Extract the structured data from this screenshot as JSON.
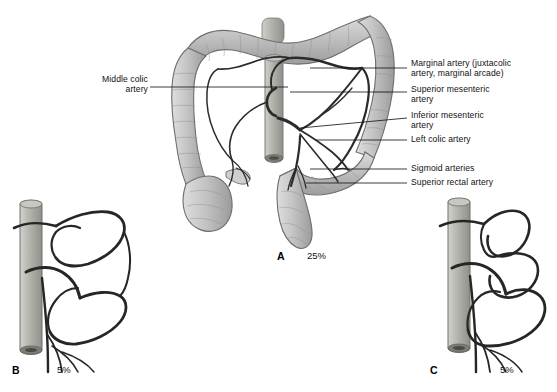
{
  "figure": {
    "background_color": "#ffffff",
    "colon_fill_light": "#d6d6d6",
    "colon_fill_mid": "#b9b9b9",
    "colon_fill_dark": "#9a9a9a",
    "colon_outline": "#6e6e6e",
    "vessel_color": "#2b2b2b",
    "aorta_fill": "#b5b5b0",
    "leader_color": "#1a1a1a",
    "text_color": "#111111"
  },
  "labels": {
    "left": [
      {
        "id": "middle-colic-artery",
        "text": "Middle colic artery",
        "x": 78,
        "y": 79,
        "leader": {
          "x1": 150,
          "y1": 87,
          "x2": 288,
          "y2": 87
        }
      }
    ],
    "right": [
      {
        "id": "marginal-artery",
        "text": "Marginal artery (juxtacolic\nartery, marginal arcade)",
        "x": 411,
        "y": 62,
        "leader": {
          "x1": 407,
          "y1": 68,
          "x2": 310,
          "y2": 68
        }
      },
      {
        "id": "superior-mesenteric-artery",
        "text": "Superior mesenteric\nartery",
        "x": 411,
        "y": 87,
        "leader": {
          "x1": 407,
          "y1": 92,
          "x2": 290,
          "y2": 92
        }
      },
      {
        "id": "inferior-mesenteric-artery",
        "text": "Inferior mesenteric\nartery",
        "x": 411,
        "y": 113,
        "leader": {
          "x1": 407,
          "y1": 118,
          "x2": 300,
          "y2": 128
        }
      },
      {
        "id": "left-colic-artery",
        "text": "Left colic artery",
        "x": 411,
        "y": 135,
        "leader": {
          "x1": 407,
          "y1": 140,
          "x2": 316,
          "y2": 140
        }
      },
      {
        "id": "sigmoid-arteries",
        "text": "Sigmoid arteries",
        "x": 411,
        "y": 164,
        "leader": {
          "x1": 407,
          "y1": 169,
          "x2": 310,
          "y2": 169
        }
      },
      {
        "id": "superior-rectal-artery",
        "text": "Superior rectal artery",
        "x": 411,
        "y": 178,
        "leader": {
          "x1": 407,
          "y1": 183,
          "x2": 306,
          "y2": 183
        }
      }
    ]
  },
  "panels": [
    {
      "id": "panel-a",
      "letter": "A",
      "percent": "25%",
      "letter_x": 277,
      "letter_y": 256,
      "percent_x": 307,
      "percent_y": 255,
      "description": "Full colon with complete marginal artery arcade"
    },
    {
      "id": "panel-b",
      "letter": "B",
      "percent": "5%",
      "letter_x": 12,
      "letter_y": 371,
      "percent_x": 57,
      "percent_y": 371,
      "description": "Variant branching pattern of the marginal artery"
    },
    {
      "id": "panel-c",
      "letter": "C",
      "percent": "5%",
      "letter_x": 430,
      "letter_y": 371,
      "percent_x": 500,
      "percent_y": 371,
      "description": "Second variant branching pattern of the marginal artery"
    }
  ]
}
